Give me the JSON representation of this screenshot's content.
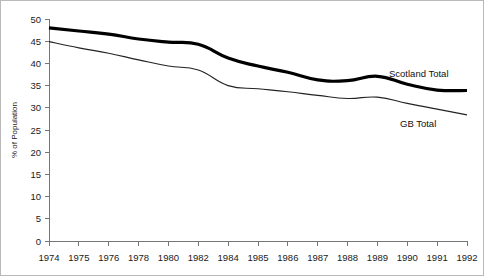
{
  "chart_data": {
    "type": "line",
    "title": "",
    "xlabel": "",
    "ylabel": "% of Population",
    "ylim": [
      0,
      50
    ],
    "ytick_step": 5,
    "grid": false,
    "legend_position": "inline-right",
    "categories": [
      "1974",
      "1975",
      "1976",
      "1978",
      "1980",
      "1982",
      "1984",
      "1985",
      "1986",
      "1987",
      "1988",
      "1989",
      "1990",
      "1991",
      "1992"
    ],
    "yticks": [
      "0",
      "5",
      "10",
      "15",
      "20",
      "25",
      "30",
      "35",
      "40",
      "45",
      "50"
    ],
    "series": [
      {
        "name": "Scotland Total",
        "color": "#000000",
        "line_width": 3.2,
        "values": [
          48.0,
          47.3,
          46.6,
          45.5,
          44.8,
          44.3,
          41.2,
          39.4,
          38.0,
          36.3,
          36.1,
          37.1,
          35.3,
          34.0,
          33.9
        ]
      },
      {
        "name": "GB Total",
        "color": "#222222",
        "line_width": 1.1,
        "values": [
          44.9,
          43.5,
          42.3,
          40.8,
          39.4,
          38.5,
          35.0,
          34.3,
          33.6,
          32.8,
          32.1,
          32.4,
          31.0,
          29.7,
          28.4
        ]
      }
    ]
  },
  "labels": {
    "scotland_total": "Scotland Total",
    "gb_total": "GB Total",
    "y_axis_title": "% of Population"
  }
}
